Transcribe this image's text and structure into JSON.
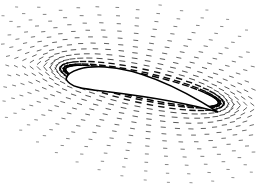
{
  "chart_data": {
    "type": "quiver",
    "title": "",
    "xlabel": "",
    "ylabel": "",
    "grid": false,
    "legend": null,
    "airfoil": {
      "leading_edge": [
        66,
        79
      ],
      "trailing_edge": [
        218,
        112
      ],
      "upper_peak": [
        100,
        67
      ],
      "fill": "#ffffff",
      "outline": "#000000"
    },
    "field": {
      "rings": 14,
      "spokes": 44,
      "vector_color": "#222222",
      "near_surface_color": "#000000"
    }
  },
  "canvas": {
    "width": 256,
    "height": 188,
    "background": "#ffffff"
  }
}
